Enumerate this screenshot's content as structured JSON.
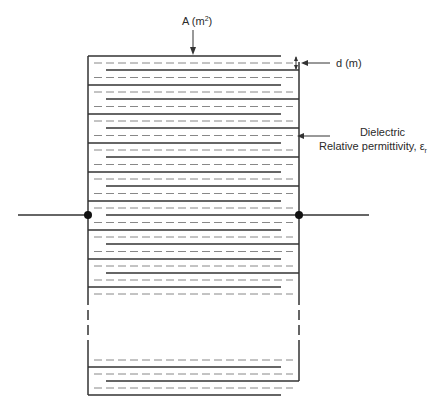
{
  "diagram": {
    "type": "multilayer-capacitor-cross-section",
    "labels": {
      "area_prefix": "A (m",
      "area_exp": "2",
      "area_suffix": ")",
      "thickness": "d (m)",
      "dielectric_line1": "Dielectric",
      "dielectric_line2": "Relative permittivity, ε",
      "dielectric_sub": "r"
    },
    "colors": {
      "line": "#333333",
      "dashed": "#888888",
      "background": "#ffffff"
    },
    "plates_top": [
      {
        "y": 56,
        "side": "left"
      },
      {
        "y": 70,
        "side": "right"
      },
      {
        "y": 85,
        "side": "left"
      },
      {
        "y": 99,
        "side": "right"
      },
      {
        "y": 114,
        "side": "left"
      },
      {
        "y": 128,
        "side": "right"
      },
      {
        "y": 143,
        "side": "left"
      },
      {
        "y": 157,
        "side": "right"
      },
      {
        "y": 172,
        "side": "left"
      },
      {
        "y": 186,
        "side": "right"
      },
      {
        "y": 201,
        "side": "left"
      },
      {
        "y": 215,
        "side": "right"
      },
      {
        "y": 230,
        "side": "left"
      },
      {
        "y": 244,
        "side": "right"
      },
      {
        "y": 259,
        "side": "left"
      },
      {
        "y": 273,
        "side": "right"
      },
      {
        "y": 287,
        "side": "left"
      }
    ],
    "plates_bottom": [
      {
        "y": 367,
        "side": "left"
      },
      {
        "y": 381,
        "side": "right"
      },
      {
        "y": 395,
        "side": "left"
      }
    ],
    "terminals": {
      "lead_y": 215,
      "left_lead_start_x": 18,
      "left_node_x": 88,
      "right_node_x": 299,
      "right_lead_end_x": 369
    }
  }
}
